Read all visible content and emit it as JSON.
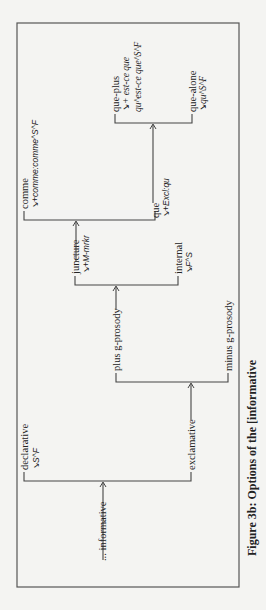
{
  "figure": {
    "caption": "Figure 3b: Options of the [informative",
    "entry": "... informative",
    "systems": {
      "informative": {
        "options": [
          "declarative",
          "exclamative"
        ],
        "declarative_realization": "↘S^F"
      },
      "exclamative": {
        "options": [
          "plus g-prosody",
          "minus g-prosody"
        ]
      },
      "minus_g_prosody": {
        "options": [
          "juncture",
          "internal"
        ],
        "juncture_realization": "↘+M-mrkr",
        "internal_realization": "↘F^S"
      },
      "juncture": {
        "options": [
          "comme",
          "que"
        ],
        "comme_realization": "↘+comme:comme^S^F",
        "que_realization": "↘+Excl:qu"
      },
      "que": {
        "options": [
          "que-plus",
          "que-alone"
        ],
        "que_plus_realization_1": "↘+ est-ce que",
        "que_plus_realization_2": "qu^est-ce que^S^F",
        "que_alone_realization": "↘qu^S^F"
      }
    }
  }
}
